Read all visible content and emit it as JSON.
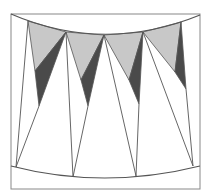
{
  "diagram": {
    "colors": {
      "background": "#ffffff",
      "stroke": "#555555",
      "frame": "#888888",
      "light_fill": "#c8c8c8",
      "dark_fill": "#4a4a4a"
    },
    "frame": {
      "x": 11,
      "y": 14,
      "width": 189,
      "height": 175
    },
    "top_arc": {
      "start": [
        11,
        14
      ],
      "control": [
        104,
        54
      ],
      "end": [
        200,
        15
      ]
    },
    "bottom_arc": {
      "start": [
        11,
        166
      ],
      "control": [
        104,
        190
      ],
      "end": [
        200,
        166
      ]
    },
    "top_vertices": [
      [
        28,
        21
      ],
      [
        66,
        32
      ],
      [
        104,
        35
      ],
      [
        143,
        32
      ],
      [
        181,
        22
      ]
    ],
    "bottom_vertices": [
      [
        16,
        167
      ],
      [
        73,
        177
      ],
      [
        136,
        176
      ],
      [
        193,
        166
      ]
    ],
    "light_triangles": [
      [
        [
          28,
          21
        ],
        [
          66,
          32
        ],
        [
          35,
          71
        ]
      ],
      [
        [
          66,
          32
        ],
        [
          104,
          35
        ],
        [
          81,
          80
        ]
      ],
      [
        [
          104,
          35
        ],
        [
          143,
          32
        ],
        [
          129,
          80
        ]
      ],
      [
        [
          143,
          32
        ],
        [
          181,
          22
        ],
        [
          175,
          72
        ]
      ]
    ],
    "dark_triangles": [
      [
        [
          66,
          32
        ],
        [
          35,
          71
        ],
        [
          39,
          106
        ]
      ],
      [
        [
          104,
          35
        ],
        [
          81,
          80
        ],
        [
          88,
          106
        ]
      ],
      [
        [
          143,
          32
        ],
        [
          129,
          80
        ],
        [
          139,
          104
        ]
      ],
      [
        [
          181,
          22
        ],
        [
          175,
          72
        ],
        [
          186,
          89
        ]
      ]
    ],
    "lines": [
      [
        [
          28,
          21
        ],
        [
          16,
          167
        ]
      ],
      [
        [
          39,
          106
        ],
        [
          16,
          167
        ]
      ],
      [
        [
          66,
          32
        ],
        [
          73,
          177
        ]
      ],
      [
        [
          88,
          106
        ],
        [
          73,
          177
        ]
      ],
      [
        [
          104,
          35
        ],
        [
          136,
          176
        ]
      ],
      [
        [
          139,
          104
        ],
        [
          136,
          176
        ]
      ],
      [
        [
          143,
          32
        ],
        [
          193,
          166
        ]
      ],
      [
        [
          186,
          89
        ],
        [
          193,
          166
        ]
      ]
    ]
  }
}
